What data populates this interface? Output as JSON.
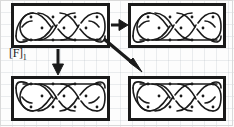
{
  "figure": {
    "type": "diagram",
    "background_color": "#fdfdfd",
    "ink_color": "#1a1a1a",
    "grid_visible": true
  },
  "label": {
    "text": "[F]",
    "subscript": "1"
  },
  "panels": [
    {
      "id": "panel-top-left",
      "name": "knot-panel-top-left",
      "position": {
        "x": 11,
        "y": 3,
        "width": 99,
        "height": 45
      },
      "knot": {
        "style": "celtic-plait",
        "crossings": 6,
        "dots": 10,
        "has_bottom_bar": true,
        "has_top_bar": false
      }
    },
    {
      "id": "panel-top-right",
      "name": "knot-panel-top-right",
      "position": {
        "x": 128,
        "y": 3,
        "width": 98,
        "height": 45
      },
      "knot": {
        "style": "celtic-plait",
        "crossings": 6,
        "dots": 10,
        "has_bottom_bar": true,
        "has_top_bar": false
      }
    },
    {
      "id": "panel-bottom-left",
      "name": "knot-panel-bottom-left",
      "position": {
        "x": 11,
        "y": 76,
        "width": 99,
        "height": 45
      },
      "knot": {
        "style": "celtic-plait",
        "crossings": 6,
        "dots": 10,
        "has_bottom_bar": false,
        "has_top_bar": true
      }
    },
    {
      "id": "panel-bottom-right",
      "name": "knot-panel-bottom-right",
      "position": {
        "x": 128,
        "y": 76,
        "width": 98,
        "height": 45
      },
      "knot": {
        "style": "celtic-plait",
        "crossings": 6,
        "dots": 10,
        "has_bottom_bar": false,
        "has_top_bar": true
      }
    }
  ],
  "arrows": [
    {
      "id": "arrow-right",
      "name": "arrow-top-left-to-top-right",
      "direction": "right",
      "from": "panel-top-left",
      "to": "panel-top-right",
      "x1": 111,
      "y1": 25,
      "x2": 127,
      "y2": 25
    },
    {
      "id": "arrow-down",
      "name": "arrow-top-left-to-bottom-left",
      "direction": "down",
      "from": "panel-top-left",
      "to": "panel-bottom-left",
      "x1": 58,
      "y1": 49,
      "x2": 58,
      "y2": 75
    },
    {
      "id": "arrow-diagonal",
      "name": "arrow-top-left-to-bottom-right",
      "direction": "down-right",
      "from": "panel-top-left",
      "to": "panel-bottom-right",
      "x1": 106,
      "y1": 40,
      "x2": 142,
      "y2": 71
    }
  ]
}
